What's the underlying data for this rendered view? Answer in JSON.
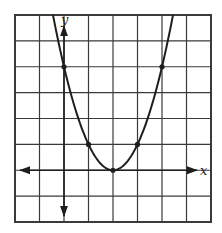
{
  "chart_data": {
    "type": "line",
    "title": "",
    "xlabel": "x",
    "ylabel": "y",
    "xlim": [
      -2,
      6
    ],
    "ylim": [
      -2,
      6
    ],
    "grid": true,
    "grid_step": 1,
    "tick_labels_shown": false,
    "series": [
      {
        "name": "parabola y = (x - 2)^2",
        "equation": "y = (x - 2)^2",
        "x": [
          -0.45,
          0,
          1,
          2,
          3,
          4,
          4.45
        ],
        "y": [
          6,
          4,
          1,
          0,
          1,
          4,
          6
        ]
      }
    ],
    "marked_points": [
      {
        "x": 0,
        "y": 4
      },
      {
        "x": 1,
        "y": 1
      },
      {
        "x": 2,
        "y": 0
      },
      {
        "x": 3,
        "y": 1
      },
      {
        "x": 4,
        "y": 4
      }
    ]
  },
  "labels": {
    "x_axis": "x",
    "y_axis": "y"
  },
  "colors": {
    "grid": "#3a3a3a",
    "curve": "#1e1e1e",
    "background": "#ffffff"
  }
}
